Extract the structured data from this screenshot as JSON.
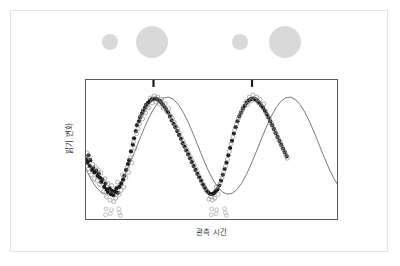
{
  "figure": {
    "name": "variable-star-light-curve",
    "background_color": "#ffffff",
    "outer_border_color": "#e3e3e3",
    "plot_border_color": "#5a5a5a"
  },
  "phase_illustration": {
    "name": "star-size-phase-strip",
    "description": "Alternating small and large gray disks showing pulsating star size",
    "disk_color": "#d9d9d9",
    "disks": [
      {
        "label": "contracted-star-1",
        "cx": 25,
        "cy": 22,
        "r": 8
      },
      {
        "label": "expanded-star-1",
        "cx": 67,
        "cy": 22,
        "r": 16
      },
      {
        "label": "contracted-star-2",
        "cx": 155,
        "cy": 22,
        "r": 8
      },
      {
        "label": "expanded-star-2",
        "cx": 200,
        "cy": 22,
        "r": 16
      }
    ]
  },
  "chart_data": {
    "type": "scatter",
    "title": "",
    "subtitle": "",
    "xlabel": "관측 시간",
    "ylabel": "밝기 변화",
    "grid": false,
    "legend": false,
    "xlim": [
      0,
      2.08
    ],
    "ylim": [
      -1.55,
      1.35
    ],
    "axis_ticks_shown": false,
    "fit_curve": {
      "name": "sinusoidal-fit",
      "color": "#555555",
      "form": "y = A*sin(2*pi*(x - x0)/P)",
      "amplitude": 1.0,
      "period": 1.0,
      "phase_offset_x": 0.42,
      "samples_x": [
        0,
        0.04,
        0.08,
        0.12,
        0.16,
        0.2,
        0.24,
        0.28,
        0.32,
        0.36,
        0.4,
        0.44,
        0.48,
        0.52,
        0.56,
        0.6,
        0.64,
        0.68,
        0.72,
        0.76,
        0.8,
        0.84,
        0.88,
        0.92,
        0.96,
        1.0,
        1.04,
        1.08,
        1.12,
        1.16,
        1.2,
        1.24,
        1.28,
        1.32,
        1.36,
        1.4,
        1.44,
        1.48,
        1.52,
        1.56,
        1.6,
        1.64,
        1.68,
        1.72,
        1.76,
        1.8,
        1.84,
        1.88,
        1.92,
        1.96,
        2.0,
        2.04,
        2.08
      ]
    },
    "series": [
      {
        "name": "filled-observations",
        "marker": "filled-circle",
        "color": "#1c1c1c",
        "size": 2.1,
        "points": [
          [
            0.005,
            -0.28
          ],
          [
            0.012,
            -0.35
          ],
          [
            0.02,
            -0.2
          ],
          [
            0.03,
            -0.42
          ],
          [
            0.035,
            -0.3
          ],
          [
            0.05,
            -0.5
          ],
          [
            0.06,
            -0.46
          ],
          [
            0.07,
            -0.55
          ],
          [
            0.085,
            -0.52
          ],
          [
            0.095,
            -0.62
          ],
          [
            0.105,
            -0.58
          ],
          [
            0.115,
            -0.66
          ],
          [
            0.125,
            -0.75
          ],
          [
            0.135,
            -0.7
          ],
          [
            0.15,
            -0.85
          ],
          [
            0.16,
            -0.78
          ],
          [
            0.17,
            -0.9
          ],
          [
            0.18,
            -0.95
          ],
          [
            0.195,
            -0.88
          ],
          [
            0.205,
            -1.0
          ],
          [
            0.215,
            -0.93
          ],
          [
            0.225,
            -1.02
          ],
          [
            0.24,
            -0.95
          ],
          [
            0.25,
            -0.88
          ],
          [
            0.26,
            -0.97
          ],
          [
            0.275,
            -0.85
          ],
          [
            0.29,
            -0.78
          ],
          [
            0.305,
            -0.7
          ],
          [
            0.315,
            -0.62
          ],
          [
            0.33,
            -0.5
          ],
          [
            0.345,
            -0.38
          ],
          [
            0.355,
            -0.3
          ],
          [
            0.37,
            -0.12
          ],
          [
            0.385,
            0.02
          ],
          [
            0.395,
            0.15
          ],
          [
            0.41,
            0.3
          ],
          [
            0.42,
            0.42
          ],
          [
            0.435,
            0.5
          ],
          [
            0.445,
            0.58
          ],
          [
            0.46,
            0.66
          ],
          [
            0.47,
            0.72
          ],
          [
            0.485,
            0.78
          ],
          [
            0.495,
            0.84
          ],
          [
            0.51,
            0.88
          ],
          [
            0.525,
            0.92
          ],
          [
            0.54,
            0.95
          ],
          [
            0.555,
            0.96
          ],
          [
            0.57,
            0.97
          ],
          [
            0.585,
            0.95
          ],
          [
            0.6,
            0.93
          ],
          [
            0.615,
            0.9
          ],
          [
            0.63,
            0.85
          ],
          [
            0.645,
            0.8
          ],
          [
            0.66,
            0.74
          ],
          [
            0.675,
            0.68
          ],
          [
            0.69,
            0.6
          ],
          [
            0.705,
            0.52
          ],
          [
            0.72,
            0.45
          ],
          [
            0.735,
            0.38
          ],
          [
            0.75,
            0.3
          ],
          [
            0.765,
            0.22
          ],
          [
            0.78,
            0.14
          ],
          [
            0.795,
            0.05
          ],
          [
            0.81,
            -0.02
          ],
          [
            0.825,
            -0.1
          ],
          [
            0.84,
            -0.18
          ],
          [
            0.855,
            -0.26
          ],
          [
            0.87,
            -0.34
          ],
          [
            0.885,
            -0.42
          ],
          [
            0.9,
            -0.5
          ],
          [
            0.915,
            -0.58
          ],
          [
            0.93,
            -0.65
          ],
          [
            0.945,
            -0.72
          ],
          [
            0.96,
            -0.8
          ],
          [
            0.975,
            -0.86
          ],
          [
            0.99,
            -0.92
          ],
          [
            1.005,
            -0.96
          ],
          [
            1.02,
            -0.99
          ],
          [
            1.035,
            -1.0
          ],
          [
            1.05,
            -0.98
          ],
          [
            1.065,
            -0.94
          ],
          [
            1.08,
            -0.9
          ],
          [
            1.095,
            -0.82
          ],
          [
            1.11,
            -0.72
          ],
          [
            1.125,
            -0.6
          ],
          [
            1.14,
            -0.48
          ],
          [
            1.155,
            -0.35
          ],
          [
            1.17,
            -0.2
          ],
          [
            1.185,
            -0.05
          ],
          [
            1.2,
            0.1
          ],
          [
            1.215,
            0.25
          ],
          [
            1.23,
            0.38
          ],
          [
            1.245,
            0.5
          ],
          [
            1.26,
            0.6
          ],
          [
            1.275,
            0.68
          ],
          [
            1.29,
            0.76
          ],
          [
            1.305,
            0.82
          ],
          [
            1.32,
            0.88
          ],
          [
            1.335,
            0.92
          ],
          [
            1.35,
            0.95
          ],
          [
            1.365,
            0.96
          ],
          [
            1.38,
            0.97
          ],
          [
            1.395,
            0.95
          ],
          [
            1.41,
            0.92
          ],
          [
            1.425,
            0.88
          ],
          [
            1.44,
            0.83
          ],
          [
            1.455,
            0.78
          ],
          [
            1.47,
            0.72
          ],
          [
            1.485,
            0.65
          ],
          [
            1.5,
            0.58
          ],
          [
            1.515,
            0.5
          ],
          [
            1.53,
            0.42
          ],
          [
            1.545,
            0.34
          ],
          [
            1.56,
            0.26
          ],
          [
            1.575,
            0.18
          ],
          [
            1.59,
            0.1
          ],
          [
            1.605,
            0.02
          ],
          [
            1.62,
            -0.06
          ],
          [
            1.635,
            -0.14
          ],
          [
            1.65,
            -0.22
          ]
        ]
      },
      {
        "name": "open-observations",
        "marker": "open-circle",
        "color": "#8f8f8f",
        "size": 2.0,
        "points": [
          [
            0.008,
            -0.15
          ],
          [
            0.018,
            -0.48
          ],
          [
            0.028,
            -0.25
          ],
          [
            0.042,
            -0.6
          ],
          [
            0.055,
            -0.38
          ],
          [
            0.068,
            -0.68
          ],
          [
            0.078,
            -0.44
          ],
          [
            0.09,
            -0.72
          ],
          [
            0.1,
            -0.5
          ],
          [
            0.112,
            -0.8
          ],
          [
            0.122,
            -0.56
          ],
          [
            0.14,
            -0.95
          ],
          [
            0.155,
            -0.68
          ],
          [
            0.168,
            -1.05
          ],
          [
            0.182,
            -0.78
          ],
          [
            0.198,
            -1.12
          ],
          [
            0.212,
            -0.82
          ],
          [
            0.228,
            -1.15
          ],
          [
            0.245,
            -1.08
          ],
          [
            0.258,
            -0.75
          ],
          [
            0.272,
            -1.0
          ],
          [
            0.288,
            -0.92
          ],
          [
            0.3,
            -0.6
          ],
          [
            0.312,
            -0.85
          ],
          [
            0.328,
            -0.65
          ],
          [
            0.34,
            -0.45
          ],
          [
            0.35,
            -0.55
          ],
          [
            0.365,
            -0.25
          ],
          [
            0.378,
            -0.35
          ],
          [
            0.39,
            0.08
          ],
          [
            0.402,
            -0.05
          ],
          [
            0.415,
            0.25
          ],
          [
            0.428,
            0.35
          ],
          [
            0.44,
            0.45
          ],
          [
            0.452,
            0.62
          ],
          [
            0.465,
            0.55
          ],
          [
            0.478,
            0.72
          ],
          [
            0.49,
            0.68
          ],
          [
            0.502,
            0.82
          ],
          [
            0.515,
            0.78
          ],
          [
            0.53,
            0.98
          ],
          [
            0.545,
            0.88
          ],
          [
            0.56,
            1.02
          ],
          [
            0.575,
            0.9
          ],
          [
            0.59,
            1.0
          ],
          [
            0.605,
            0.86
          ],
          [
            0.62,
            0.95
          ],
          [
            0.635,
            0.78
          ],
          [
            0.65,
            0.86
          ],
          [
            0.665,
            0.7
          ],
          [
            0.68,
            0.76
          ],
          [
            0.695,
            0.62
          ],
          [
            0.71,
            0.56
          ],
          [
            0.725,
            0.48
          ],
          [
            0.74,
            0.4
          ],
          [
            0.755,
            0.34
          ],
          [
            0.77,
            0.25
          ],
          [
            0.785,
            0.16
          ],
          [
            0.8,
            0.08
          ],
          [
            0.815,
            0.0
          ],
          [
            0.83,
            -0.08
          ],
          [
            0.845,
            -0.16
          ],
          [
            0.86,
            -0.24
          ],
          [
            0.875,
            -0.32
          ],
          [
            0.89,
            -0.4
          ],
          [
            0.905,
            -0.48
          ],
          [
            0.92,
            -0.56
          ],
          [
            0.935,
            -0.64
          ],
          [
            0.95,
            -0.72
          ],
          [
            0.965,
            -0.8
          ],
          [
            0.98,
            -0.88
          ],
          [
            0.995,
            -0.94
          ],
          [
            1.01,
            -1.1
          ],
          [
            1.025,
            -1.05
          ],
          [
            1.04,
            -1.12
          ],
          [
            1.058,
            -1.08
          ],
          [
            1.072,
            -0.85
          ],
          [
            1.088,
            -1.0
          ],
          [
            1.102,
            -0.78
          ],
          [
            1.118,
            -0.66
          ],
          [
            1.132,
            -0.55
          ],
          [
            1.148,
            -0.42
          ],
          [
            1.162,
            -0.28
          ],
          [
            1.178,
            -0.12
          ],
          [
            1.192,
            0.04
          ],
          [
            1.208,
            0.18
          ],
          [
            1.222,
            0.32
          ],
          [
            1.238,
            0.44
          ],
          [
            1.252,
            0.56
          ],
          [
            1.268,
            0.64
          ],
          [
            1.282,
            0.72
          ],
          [
            1.298,
            0.8
          ],
          [
            1.312,
            0.9
          ],
          [
            1.328,
            0.85
          ],
          [
            1.342,
            1.0
          ],
          [
            1.358,
            0.92
          ],
          [
            1.372,
            1.04
          ],
          [
            1.388,
            0.94
          ],
          [
            1.402,
            1.0
          ],
          [
            1.418,
            0.88
          ],
          [
            1.432,
            0.95
          ],
          [
            1.448,
            0.8
          ],
          [
            1.462,
            0.86
          ],
          [
            1.478,
            0.7
          ],
          [
            1.492,
            0.62
          ],
          [
            1.508,
            0.55
          ],
          [
            1.522,
            0.46
          ],
          [
            1.538,
            0.38
          ],
          [
            1.552,
            0.3
          ],
          [
            1.568,
            0.22
          ],
          [
            1.582,
            0.14
          ],
          [
            1.598,
            0.06
          ],
          [
            1.612,
            -0.02
          ],
          [
            1.628,
            -0.1
          ],
          [
            1.642,
            -0.18
          ],
          [
            1.655,
            -0.26
          ]
        ]
      },
      {
        "name": "low-outliers",
        "marker": "open-circle",
        "color": "#a8a8a8",
        "size": 1.9,
        "points": [
          [
            0.16,
            -1.42
          ],
          [
            0.2,
            -1.4
          ],
          [
            0.275,
            -1.38
          ],
          [
            0.285,
            -1.44
          ],
          [
            0.165,
            -1.3
          ],
          [
            0.21,
            -1.32
          ],
          [
            0.27,
            -1.3
          ],
          [
            1.03,
            -1.42
          ],
          [
            1.07,
            -1.4
          ],
          [
            1.145,
            -1.38
          ],
          [
            1.155,
            -1.44
          ],
          [
            1.035,
            -1.3
          ],
          [
            1.075,
            -1.32
          ],
          [
            1.14,
            -1.3
          ]
        ]
      },
      {
        "name": "top-error-marks",
        "marker": "filled-bar",
        "color": "#1c1c1c",
        "size": 2.0,
        "points": [
          [
            0.555,
            1.28
          ],
          [
            1.365,
            1.28
          ]
        ]
      }
    ]
  }
}
